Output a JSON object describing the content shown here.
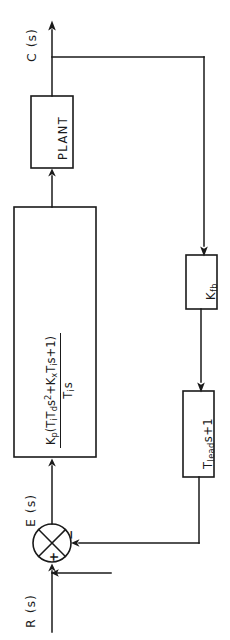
{
  "figure": {
    "type": "control-system-block-diagram",
    "orientation": "rotated-90-ccw",
    "background_color": "#ffffff",
    "line_color": "#1a1a1a"
  },
  "signals": {
    "input": "R (s)",
    "error": "E (s)",
    "output": "C (s)"
  },
  "summing_junction": {
    "plus_sign": "+",
    "minus_sign": "−",
    "plus_input": "R (s)",
    "minus_input": "feedback"
  },
  "blocks": {
    "controller": {
      "name": "pid-controller",
      "numerator_parts": {
        "gain": "K",
        "gain_sub": "p",
        "open_paren": "(",
        "t1": "T",
        "t1_sub": "i",
        "t2": "T",
        "t2_sub": "d",
        "s_squared": "s",
        "s_squared_sup": "2",
        "plus": "+K",
        "kx_sub": "x",
        "t3": "T",
        "t3_sub": "i",
        "tail": "s+1)"
      },
      "denominator_parts": {
        "t": "T",
        "t_sub": "i",
        "s": "s"
      },
      "numerator_text": "Kp(TiTds2 +KxTis+1)",
      "denominator_text": "Tis"
    },
    "plant": {
      "name": "plant",
      "label": "PLANT"
    },
    "feedback_gain": {
      "name": "feedback-gain",
      "label_main": "K",
      "label_sub": "fb",
      "label_text": "Kfb"
    },
    "lead_compensator": {
      "name": "lead-compensator",
      "label_main": "T",
      "label_sub": "lead",
      "label_tail": "s+1",
      "label_text": "Tleads+1"
    }
  }
}
